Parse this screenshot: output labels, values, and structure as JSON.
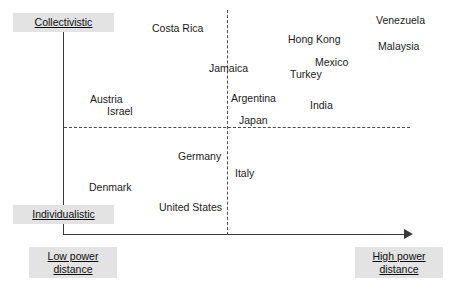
{
  "chart_data": {
    "type": "scatter",
    "title": "",
    "xlabel": "Power distance",
    "ylabel": "Collectivistic / Individualistic",
    "grid": false,
    "legend": "none",
    "axes": {
      "y_top_label": "Collectivistic",
      "y_bottom_label": "Individualistic",
      "x_left_label": "Low power distance",
      "x_right_label": "High power distance"
    },
    "quadrant_dividers": {
      "vertical_x_px": 227,
      "horizontal_y_px": 127,
      "style": "dashed"
    },
    "points": [
      {
        "label": "Costa Rica",
        "x": 152,
        "y": 22,
        "quadrant": "collectivistic-low-power"
      },
      {
        "label": "Venezuela",
        "x": 376,
        "y": 14,
        "quadrant": "collectivistic-high-power"
      },
      {
        "label": "Hong Kong",
        "x": 288,
        "y": 33,
        "quadrant": "collectivistic-high-power"
      },
      {
        "label": "Malaysia",
        "x": 378,
        "y": 40,
        "quadrant": "collectivistic-high-power"
      },
      {
        "label": "Mexico",
        "x": 315,
        "y": 56,
        "quadrant": "collectivistic-high-power"
      },
      {
        "label": "Turkey",
        "x": 290,
        "y": 68,
        "quadrant": "collectivistic-high-power"
      },
      {
        "label": "Jamaica",
        "x": 209,
        "y": 62,
        "quadrant": "collectivistic-boundary"
      },
      {
        "label": "Argentina",
        "x": 231,
        "y": 92,
        "quadrant": "collectivistic-high-power"
      },
      {
        "label": "India",
        "x": 310,
        "y": 99,
        "quadrant": "collectivistic-high-power"
      },
      {
        "label": "Japan",
        "x": 239,
        "y": 114,
        "quadrant": "collectivistic-high-power"
      },
      {
        "label": "Austria",
        "x": 90,
        "y": 93,
        "quadrant": "collectivistic-low-power"
      },
      {
        "label": "Israel",
        "x": 107,
        "y": 105,
        "quadrant": "collectivistic-low-power"
      },
      {
        "label": "Germany",
        "x": 178,
        "y": 150,
        "quadrant": "individualistic-low-power"
      },
      {
        "label": "Italy",
        "x": 235,
        "y": 167,
        "quadrant": "individualistic-high-power"
      },
      {
        "label": "Denmark",
        "x": 89,
        "y": 181,
        "quadrant": "individualistic-low-power"
      },
      {
        "label": "United States",
        "x": 159,
        "y": 201,
        "quadrant": "individualistic-low-power"
      }
    ]
  },
  "labels": {
    "collectivistic": "Collectivistic",
    "individualistic": "Individualistic",
    "low_power_line1": "Low power",
    "low_power_line2": "distance",
    "high_power_line1": "High power",
    "high_power_line2": "distance"
  },
  "colors": {
    "background": "#ffffff",
    "axis": "#3a3a3a",
    "divider": "#4a4a4a",
    "label_box_background": "#e3e3e3",
    "text": "#1a1a1a"
  }
}
